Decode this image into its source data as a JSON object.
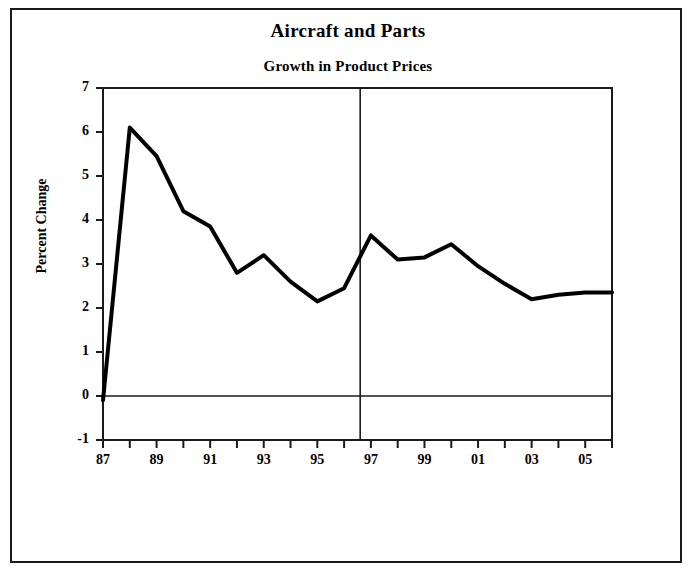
{
  "chart_data": {
    "type": "line",
    "title": "Aircraft and Parts",
    "subtitle": "Growth in Product Prices",
    "xlabel": "",
    "ylabel": "Percent Change",
    "ylim": [
      -1,
      7
    ],
    "xlim": [
      1987,
      2006
    ],
    "grid": false,
    "legend": null,
    "yticks": [
      7,
      6,
      5,
      4,
      3,
      2,
      1,
      0,
      -1
    ],
    "ytick_labels": [
      "7",
      "6",
      "5",
      "4",
      "3",
      "2",
      "1",
      "0",
      "-1"
    ],
    "xticks": [
      1987,
      1988,
      1989,
      1990,
      1991,
      1992,
      1993,
      1994,
      1995,
      1996,
      1997,
      1998,
      1999,
      2000,
      2001,
      2002,
      2003,
      2004,
      2005,
      2006
    ],
    "xtick_labels": [
      "87",
      "",
      "89",
      "",
      "91",
      "",
      "93",
      "",
      "95",
      "",
      "97",
      "",
      "99",
      "",
      "01",
      "",
      "03",
      "",
      "05",
      ""
    ],
    "x": [
      1987,
      1988,
      1989,
      1990,
      1991,
      1992,
      1993,
      1994,
      1995,
      1996,
      1997,
      1998,
      1999,
      2000,
      2001,
      2002,
      2003,
      2004,
      2005,
      2006
    ],
    "values": [
      -0.1,
      6.1,
      5.45,
      4.2,
      3.85,
      2.8,
      3.2,
      2.6,
      2.15,
      2.45,
      3.65,
      3.1,
      3.15,
      3.45,
      2.95,
      2.55,
      2.2,
      2.3,
      2.35,
      2.35
    ],
    "annotations": [
      {
        "type": "vertical-line",
        "x": 1996.6,
        "note": "history/forecast divider"
      },
      {
        "type": "horizontal-line",
        "y": 0,
        "note": "zero reference line"
      }
    ],
    "line_color": "#000000",
    "line_width": 4,
    "axis_color": "#1a1a1a",
    "background_color": "#ffffff"
  }
}
